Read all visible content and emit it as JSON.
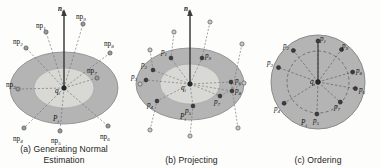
{
  "figure": {
    "background": "#fdfdfc",
    "ink": "#1b1b1b",
    "disc_outer_fill": "#b4b4b4",
    "disc_inner_fill": "#d6d6d2",
    "disc_stroke": "#8d8d8d",
    "point_fill": "#8f8f8f",
    "point_stroke": "#4a4a4a",
    "dashed_stroke": "#6f6f6f",
    "normal_stroke": "#3c3c3c"
  },
  "panels": [
    {
      "id": "a",
      "caption": "(a) Generating Normal Estimation",
      "normal_label": "n",
      "normal_sub": "i",
      "center_label": "q",
      "center_sub": "i",
      "patch_label": "P",
      "patch_sub": "i",
      "points": [
        {
          "name": "np",
          "sub": "1",
          "x": 46,
          "y": 32,
          "lx": 36,
          "ly": 23
        },
        {
          "name": "np",
          "sub": "2",
          "x": 26,
          "y": 48,
          "lx": 13,
          "ly": 39
        },
        {
          "name": "np",
          "sub": "3",
          "x": 18,
          "y": 89,
          "lx": 9,
          "ly": 82
        },
        {
          "name": "np",
          "sub": "4",
          "x": 24,
          "y": 128,
          "lx": 15,
          "ly": 136
        },
        {
          "name": "np",
          "sub": "5",
          "x": 60,
          "y": 131,
          "lx": 51,
          "ly": 140
        },
        {
          "name": "np",
          "sub": "6",
          "x": 108,
          "y": 126,
          "lx": 100,
          "ly": 136
        },
        {
          "name": "np",
          "sub": "7",
          "x": 97,
          "y": 78,
          "lx": 87,
          "ly": 70
        },
        {
          "name": "np",
          "sub": "8",
          "x": 110,
          "y": 53,
          "lx": 103,
          "ly": 43
        },
        {
          "name": "np",
          "sub": "9",
          "x": 83,
          "y": 24,
          "lx": 76,
          "ly": 16
        }
      ]
    },
    {
      "id": "b",
      "caption": "(b) Projecting",
      "normal_label": "n",
      "normal_sub": "i",
      "center_label": "q",
      "center_sub": "i",
      "patch_label": "P",
      "patch_sub": "i",
      "source_points": [
        {
          "x": 46,
          "y": 32
        },
        {
          "x": 22,
          "y": 50
        },
        {
          "x": 12,
          "y": 84
        },
        {
          "x": 22,
          "y": 130
        },
        {
          "x": 62,
          "y": 136
        },
        {
          "x": 110,
          "y": 128
        },
        {
          "x": 116,
          "y": 83
        },
        {
          "x": 114,
          "y": 44
        },
        {
          "x": 82,
          "y": 22
        }
      ],
      "projected_points": [
        {
          "name": "p",
          "sub": "1",
          "x": 43,
          "y": 58,
          "lx": 33,
          "ly": 51
        },
        {
          "name": "p",
          "sub": "2",
          "x": 25,
          "y": 70,
          "lx": 14,
          "ly": 64
        },
        {
          "name": "p",
          "sub": "3",
          "x": 18,
          "y": 80,
          "lx": 6,
          "ly": 76
        },
        {
          "name": "p",
          "sub": "4",
          "x": 29,
          "y": 101,
          "lx": 20,
          "ly": 104
        },
        {
          "name": "p",
          "sub": "5",
          "x": 65,
          "y": 106,
          "lx": 57,
          "ly": 110
        },
        {
          "name": "p",
          "sub": "6",
          "x": 103,
          "y": 82,
          "lx": 105,
          "ly": 81
        },
        {
          "name": "p",
          "sub": "7",
          "x": 92,
          "y": 96,
          "lx": 88,
          "ly": 102
        },
        {
          "name": "p",
          "sub": "8",
          "x": 104,
          "y": 91,
          "lx": 104,
          "ly": 92
        },
        {
          "name": "p",
          "sub": "9",
          "x": 74,
          "y": 58,
          "lx": 77,
          "ly": 55
        }
      ]
    },
    {
      "id": "c",
      "caption": "(c) Ordering",
      "center_label": "q",
      "center_sub": "i",
      "patch_label": "P",
      "patch_sub": "i",
      "ordered_points": [
        {
          "name": "p",
          "sub": "1",
          "angle": 90,
          "radius": 41,
          "lx": 61,
          "ly": 38
        },
        {
          "name": "p",
          "sub": "2",
          "angle": 128,
          "radius": 40,
          "lx": 24,
          "ly": 45
        },
        {
          "name": "p",
          "sub": "3",
          "angle": 160,
          "radius": 42,
          "lx": 8,
          "ly": 61
        },
        {
          "name": "p",
          "sub": "4",
          "angle": 212,
          "radius": 40,
          "lx": 19,
          "ly": 107
        },
        {
          "name": "p",
          "sub": "5",
          "angle": 268,
          "radius": 32,
          "lx": 57,
          "ly": 119
        },
        {
          "name": "p",
          "sub": "6",
          "angle": 350,
          "radius": 38,
          "lx": 103,
          "ly": 90
        },
        {
          "name": "p",
          "sub": "7",
          "angle": 318,
          "radius": 30,
          "lx": 78,
          "ly": 100
        },
        {
          "name": "p",
          "sub": "8",
          "angle": 16,
          "radius": 36,
          "lx": 99,
          "ly": 72
        },
        {
          "name": "p",
          "sub": "9",
          "angle": 54,
          "radius": 40,
          "lx": 83,
          "ly": 44
        }
      ]
    }
  ]
}
